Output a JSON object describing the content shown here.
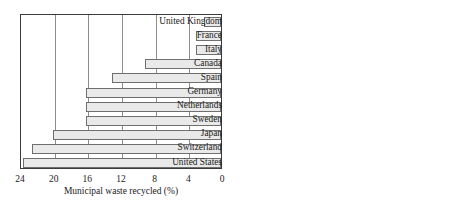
{
  "chart_data": [
    {
      "type": "bar",
      "orientation": "horizontal",
      "panel": "left",
      "title": "",
      "xlabel": "Municipal waste recycled (%)",
      "ylabel": "",
      "xlim": [
        24,
        0
      ],
      "x_ticks": [
        24,
        20,
        16,
        12,
        8,
        4,
        0
      ],
      "axis_reversed": true,
      "grid": true,
      "legend": "none",
      "categories": [
        "United Kingdom",
        "France",
        "Italy",
        "Canada",
        "Spain",
        "Germany",
        "Netherlands",
        "Sweden",
        "Japan",
        "Switzerland",
        "United States"
      ],
      "values": [
        2,
        3,
        3,
        9,
        13,
        16,
        16,
        16,
        20,
        22.5,
        23.5
      ]
    },
    {
      "type": "bar",
      "orientation": "horizontal",
      "panel": "right",
      "title": "",
      "xlabel": "Mass of municipal waste recycled (million metric tonnes · year⁻¹)",
      "xlabel_line1": "Mass of municipal waste recycled",
      "xlabel_line2_prefix": "(million metric tonnes · year",
      "xlabel_line2_sup": "−1",
      "xlabel_line2_suffix": ")",
      "ylabel": "",
      "xlim": [
        0,
        60
      ],
      "x_ticks": [
        0,
        20,
        40,
        60
      ],
      "grid": true,
      "legend": "none",
      "categories": [
        "United Kingdom",
        "France",
        "Italy",
        "Canada",
        "Spain",
        "Germany",
        "Netherlands",
        "Sweden",
        "Japan",
        "Switzerland",
        "United States"
      ],
      "values": [
        1,
        1.2,
        1.2,
        1.8,
        1.6,
        2.5,
        0.9,
        0.7,
        9,
        7.5,
        45
      ]
    }
  ],
  "categories": [
    "United Kingdom",
    "France",
    "Italy",
    "Canada",
    "Spain",
    "Germany",
    "Netherlands",
    "Sweden",
    "Japan",
    "Switzerland",
    "United States"
  ],
  "left": {
    "ticks": [
      "24",
      "20",
      "16",
      "12",
      "8",
      "4",
      "0"
    ],
    "axis_title": "Municipal waste recycled (%)"
  },
  "right": {
    "ticks": [
      "0",
      "20",
      "40",
      "60"
    ],
    "axis_title_line1": "Mass of municipal waste recycled",
    "axis_title_line2_prefix": "(million metric tonnes · year",
    "axis_title_line2_sup": "−1",
    "axis_title_line2_suffix": ")"
  },
  "colors": {
    "bar_fill": "#e9e9e9",
    "bar_stroke": "#6f6f6f",
    "axis": "#3a3a3a",
    "grid": "#8d8d8d",
    "text": "#1a1a1a"
  }
}
